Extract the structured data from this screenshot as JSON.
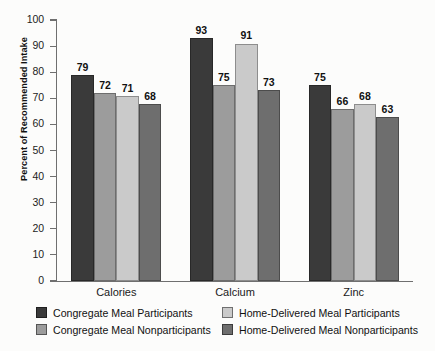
{
  "chart_data": {
    "type": "bar",
    "title": "",
    "xlabel": "",
    "ylabel": "Percent of Recommended Intake",
    "ylim": [
      0,
      100
    ],
    "ytick_step": 10,
    "yticks": [
      100,
      90,
      80,
      70,
      60,
      50,
      40,
      30,
      20,
      10,
      0
    ],
    "grid": false,
    "legend_position": "below-axis",
    "categories": [
      "Calories",
      "Calcium",
      "Zinc"
    ],
    "series": [
      {
        "name": "Congregate Meal Participants",
        "color": "#3a3a3a",
        "values": [
          79,
          93,
          75
        ]
      },
      {
        "name": "Congregate Meal Nonparticipants",
        "color": "#9c9c9c",
        "values": [
          72,
          75,
          66
        ]
      },
      {
        "name": "Home-Delivered Meal Participants",
        "color": "#cacaca",
        "values": [
          71,
          91,
          68
        ]
      },
      {
        "name": "Home-Delivered Meal Nonparticipants",
        "color": "#6e6e6e",
        "values": [
          68,
          73,
          63
        ]
      }
    ]
  }
}
